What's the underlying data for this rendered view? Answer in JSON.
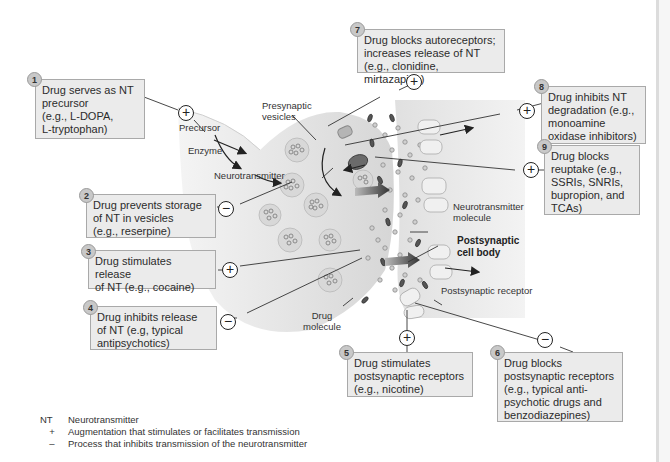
{
  "annotations": [
    {
      "number": "1",
      "text": "Drug serves as NT precursor (e.g., L-DOPA, L-tryptophan)",
      "lines": [
        "Drug serves as NT",
        "precursor",
        "(e.g., L-DOPA,",
        "L-tryptophan)"
      ],
      "effect": "+"
    },
    {
      "number": "2",
      "text": "Drug prevents storage of NT in vesicles (e.g., reserpine)",
      "lines": [
        "Drug prevents storage",
        "of NT in vesicles",
        "(e.g., reserpine)"
      ],
      "effect": "−"
    },
    {
      "number": "3",
      "text": "Drug stimulates release of NT (e.g., cocaine)",
      "lines": [
        "Drug stimulates release",
        "of NT (e.g., cocaine)"
      ],
      "effect": "+"
    },
    {
      "number": "4",
      "text": "Drug inhibits release of NT (e.g, typical antipsychotics)",
      "lines": [
        "Drug inhibits release",
        "of NT (e.g, typical",
        "antipsychotics)"
      ],
      "effect": "−"
    },
    {
      "number": "5",
      "text": "Drug stimulates postsynaptic receptors (e.g., nicotine)",
      "lines": [
        "Drug stimulates",
        "postsynaptic receptors",
        "(e.g., nicotine)"
      ],
      "effect": "+"
    },
    {
      "number": "6",
      "text": "Drug blocks postsynaptic receptors (e.g., typical anti-psychotic drugs and benzodiazepines)",
      "lines": [
        "Drug blocks",
        "postsynaptic receptors",
        "(e.g., typical anti-",
        "psychotic drugs and",
        "benzodiazepines)"
      ],
      "effect": "−"
    },
    {
      "number": "7",
      "text": "Drug blocks autoreceptors; increases release of NT (e.g., clonidine, mirtazapine)",
      "lines": [
        "Drug blocks autoreceptors;",
        "increases release of NT",
        "(e.g., clonidine, mirtazapine)"
      ],
      "effect": "+"
    },
    {
      "number": "8",
      "text": "Drug inhibits NT degradation (e.g., monoamine oxidase inhibitors)",
      "lines": [
        "Drug inhibits NT",
        "degradation (e.g.,",
        "monoamine",
        "oxidase inhibitors)"
      ],
      "effect": "+"
    },
    {
      "number": "9",
      "text": "Drug blocks reuptake (e.g., SSRIs, SNRIs, bupropion, and TCAs)",
      "lines": [
        "Drug blocks",
        "reuptake (e.g.,",
        "SSRIs, SNRIs,",
        "bupropion, and",
        "TCAs)"
      ],
      "effect": "+"
    }
  ],
  "labels": {
    "presynaptic_vesicles": [
      "Presynaptic",
      "vesicles"
    ],
    "precursor": "Precursor",
    "enzyme": "Enzyme",
    "neurotransmitter": "Neurotransmitter",
    "nt_molecule": [
      "Neurotransmitter",
      "molecule"
    ],
    "postsynaptic_cell_body": [
      "Postsynaptic",
      "cell body"
    ],
    "postsynaptic_receptor": "Postsynaptic receptor",
    "drug_molecule": [
      "Drug",
      "molecule"
    ]
  },
  "legend": [
    {
      "key": "NT",
      "text": "Neurotransmitter"
    },
    {
      "key": "+",
      "text": "Augmentation that stimulates or facilitates transmission"
    },
    {
      "key": "–",
      "text": "Process that inhibits transmission of the neurotransmitter"
    }
  ],
  "colors": {
    "box_fill": "#ebebeb",
    "box_border": "#a9a9a9",
    "badge_fill": "#c8c8c8",
    "neuron_fill": "#e6e6e6",
    "drug_color": "#444444",
    "receptor_fill": "#f2f2f2"
  }
}
